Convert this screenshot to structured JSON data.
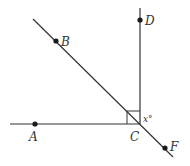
{
  "diagram": {
    "type": "geometry",
    "colors": {
      "line": "#333333",
      "point": "#1a1a1a",
      "background": "#ffffff"
    },
    "points": [
      {
        "id": "A",
        "label": "A",
        "x": 35,
        "y": 124
      },
      {
        "id": "B",
        "label": "B",
        "x": 56,
        "y": 41
      },
      {
        "id": "C",
        "label": "C",
        "x": 140,
        "y": 124
      },
      {
        "id": "D",
        "label": "D",
        "x": 140,
        "y": 20
      },
      {
        "id": "F",
        "label": "F",
        "x": 165,
        "y": 148
      }
    ],
    "lines": [
      {
        "id": "horizontal-ray-CA",
        "from": [
          10,
          124
        ],
        "to": [
          140,
          124
        ]
      },
      {
        "id": "vertical-ray-CD",
        "from": [
          140,
          8
        ],
        "to": [
          140,
          124
        ]
      },
      {
        "id": "diagonal-line-BF",
        "from": [
          33,
          19
        ],
        "to": [
          173,
          157
        ]
      }
    ],
    "right_angle": {
      "at": "C",
      "between": [
        "A",
        "D"
      ],
      "size": 13
    },
    "angle_label": {
      "text": "x°",
      "between": [
        "D",
        "F"
      ],
      "at": "C"
    }
  },
  "labels": {
    "A": "A",
    "B": "B",
    "C": "C",
    "D": "D",
    "F": "F",
    "x": "x°"
  }
}
